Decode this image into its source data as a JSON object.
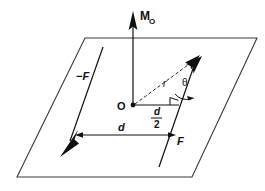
{
  "figure": {
    "background_color": "#ffffff",
    "ink_color": "#111111",
    "plane_color": "#3a3a3a",
    "width": 265,
    "height": 191
  },
  "labels": {
    "moment": "M",
    "moment_subscript": "O",
    "origin": "O",
    "force_positive": "F",
    "force_negative": "−F",
    "distance": "d",
    "half_distance_numerator": "d",
    "half_distance_denominator": "2",
    "position_vector": "r",
    "angle": "θ"
  },
  "elements": {
    "plane": {
      "name": "reference-plane",
      "points": "85,38 257,38 192,177 17,177"
    },
    "moment_axis": {
      "name": "moment-vector",
      "from": [
        133,
        105
      ],
      "to": [
        133,
        14
      ],
      "label": "M_O"
    },
    "force_line_right": {
      "name": "force-line-of-action-positive",
      "from": [
        159,
        167
      ],
      "to": [
        196,
        58
      ]
    },
    "force_line_left": {
      "name": "force-line-of-action-negative",
      "from": [
        65,
        155
      ],
      "to": [
        103,
        47
      ]
    },
    "dimension_line": {
      "name": "distance-d-dimension",
      "from": [
        72,
        135
      ],
      "to": [
        177,
        135
      ],
      "label": "d"
    },
    "half_dimension_line": {
      "name": "distance-half-d-dimension",
      "from": [
        133,
        105
      ],
      "to": [
        178,
        105
      ],
      "label": "d/2"
    },
    "position_vector": {
      "name": "position-vector-r",
      "from": [
        133,
        105
      ],
      "to": [
        198,
        57
      ],
      "style": "dashed",
      "label": "r"
    },
    "angle_arc": {
      "name": "angle-theta-arc",
      "label": "θ",
      "vertex": [
        198,
        57
      ]
    },
    "right_angle_marker": {
      "name": "right-angle-marker",
      "at": [
        178,
        105
      ]
    }
  },
  "label_positions": {
    "moment": [
      141,
      18
    ],
    "origin": [
      119,
      110
    ],
    "force_positive": [
      180,
      143
    ],
    "force_negative": [
      83,
      78
    ],
    "distance": [
      121,
      131
    ],
    "half_distance": [
      156,
      114
    ],
    "position_vector": [
      167,
      83
    ],
    "angle": [
      186,
      82
    ]
  }
}
